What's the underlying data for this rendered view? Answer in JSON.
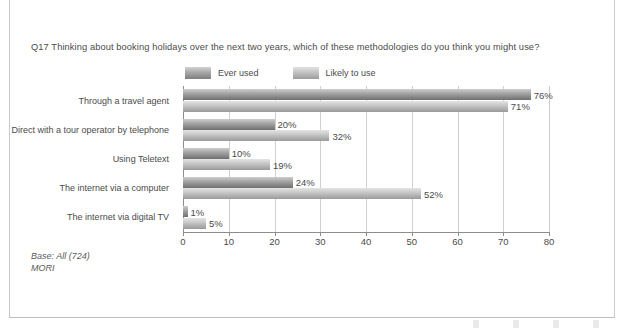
{
  "chart_data": {
    "type": "bar",
    "orientation": "horizontal",
    "title": "Q17 Thinking about booking holidays over the next two years, which of these methodologies do you think you might use?",
    "categories": [
      "Through a travel agent",
      "Direct with a tour operator by telephone",
      "Using Teletext",
      "The internet via a computer",
      "The internet via digital TV"
    ],
    "series": [
      {
        "name": "Ever used",
        "color": "#a5a5a5",
        "values": [
          76,
          20,
          10,
          24,
          1
        ],
        "labels": [
          "76%",
          "20%",
          "10%",
          "24%",
          "1%"
        ]
      },
      {
        "name": "Likely to use",
        "color": "#c8c8c8",
        "values": [
          71,
          32,
          19,
          52,
          5
        ],
        "labels": [
          "71%",
          "32%",
          "19%",
          "52%",
          "5%"
        ]
      }
    ],
    "xlabel": "",
    "ylabel": "",
    "xlim": [
      0,
      80
    ],
    "xticks": [
      0,
      10,
      20,
      30,
      40,
      50,
      60,
      70,
      80
    ],
    "xtick_labels": [
      "0",
      "10",
      "20",
      "30",
      "40",
      "50",
      "60",
      "70",
      "80"
    ],
    "grid": "vertical",
    "legend_position": "top"
  },
  "footnote": {
    "base": "Base: All (724)",
    "source": "MORI"
  }
}
